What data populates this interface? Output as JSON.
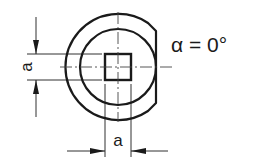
{
  "diagram": {
    "type": "technical-drawing",
    "angle_label": "α = 0°",
    "dimension_vertical_label": "a",
    "dimension_horizontal_label": "a",
    "colors": {
      "line": "#1a1a1a",
      "background": "#ffffff"
    },
    "geometry": {
      "center": [
        118,
        67
      ],
      "outer_radius": 53,
      "inner_radius": 38,
      "flat_x": 156,
      "square": {
        "x": 105,
        "y": 54,
        "size": 26
      }
    }
  }
}
